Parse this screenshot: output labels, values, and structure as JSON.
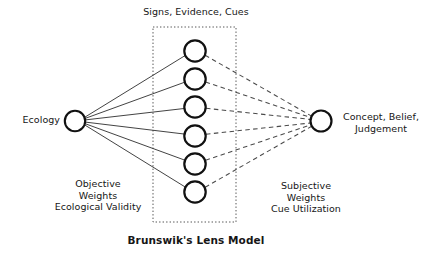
{
  "diagram": {
    "title": "Brunswik's Lens Model",
    "background_color": "#ffffff",
    "node_stroke_color": "#111111",
    "solid_line_color": "#333333",
    "dashed_line_color": "#444444",
    "box_border_color": "#555555",
    "labels": {
      "top": "Signs, Evidence, Cues",
      "left_node": "Ecology",
      "right_node": "Concept, Belief,\nJudgement",
      "left_block": "Objective\nWeights\nEcological Validity",
      "right_block": "Subjective\nWeights\nCue Utilization"
    },
    "nodes": {
      "source": {
        "id": "ecology",
        "cx": 75,
        "cy": 121,
        "r": 10.5
      },
      "target": {
        "id": "judgement",
        "cx": 321,
        "cy": 121,
        "r": 10.5
      },
      "cues": [
        {
          "id": "cue-1",
          "cx": 195,
          "cy": 51,
          "r": 11
        },
        {
          "id": "cue-2",
          "cx": 195,
          "cy": 79,
          "r": 11
        },
        {
          "id": "cue-3",
          "cx": 195,
          "cy": 107,
          "r": 11
        },
        {
          "id": "cue-4",
          "cx": 195,
          "cy": 136,
          "r": 11
        },
        {
          "id": "cue-5",
          "cx": 195,
          "cy": 164,
          "r": 11
        },
        {
          "id": "cue-6",
          "cx": 195,
          "cy": 192,
          "r": 11
        }
      ]
    },
    "lens_box": {
      "x": 153,
      "y": 27,
      "width": 83,
      "height": 195
    }
  }
}
